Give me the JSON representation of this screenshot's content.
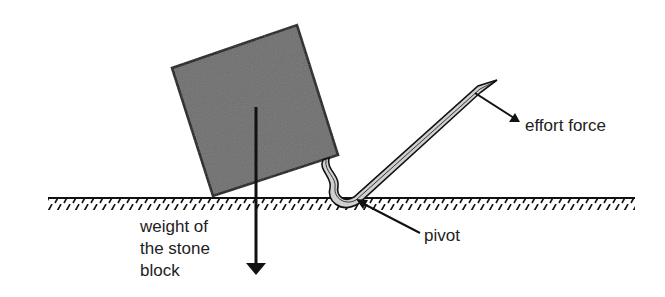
{
  "diagram": {
    "type": "lever-crowbar",
    "labels": {
      "effort": "effort force",
      "pivot": "pivot",
      "weight_line1": "weight of",
      "weight_line2": "the stone",
      "weight_line3": "block"
    },
    "colors": {
      "block_fill": "#6e6e6e",
      "outline": "#111111",
      "bar_fill": "#d0d0d0",
      "text": "#222222"
    }
  }
}
